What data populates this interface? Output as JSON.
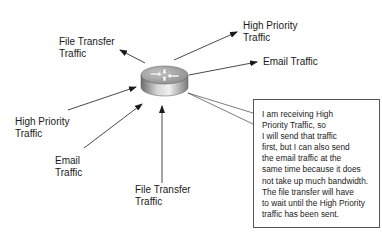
{
  "diagram": {
    "router": {
      "icon": "router-icon"
    },
    "inbound_flows": [
      {
        "id": "high-priority-in",
        "label": "High Priority\nTraffic"
      },
      {
        "id": "email-in",
        "label": "Email\nTraffic"
      },
      {
        "id": "file-transfer-in",
        "label": "File Transfer\nTraffic"
      }
    ],
    "outbound_flows": [
      {
        "id": "file-transfer-out",
        "label": "File Transfer\nTraffic"
      },
      {
        "id": "high-priority-out",
        "label": "High Priority\nTraffic"
      },
      {
        "id": "email-out",
        "label": "Email Traffic"
      }
    ],
    "callout_text": "I am receiving High\nPriority Traffic, so\nI will send that traffic\nfirst, but I can also send\nthe email traffic at the\nsame time because it does\nnot take up much bandwidth.\nThe file transfer will have\nto wait until the High Priority\ntraffic has been sent."
  }
}
